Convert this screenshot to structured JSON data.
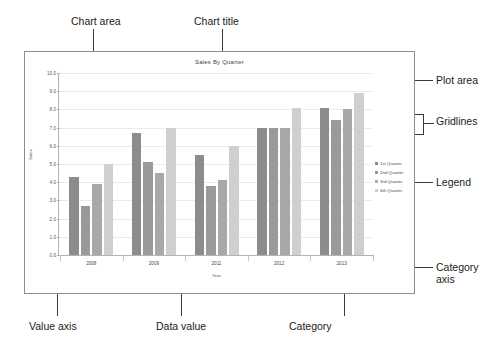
{
  "figure": {
    "annotations": {
      "chart_area": "Chart area",
      "chart_title": "Chart title",
      "data_series": "Data series",
      "plot_area": "Plot area",
      "gridlines": "Gridlines",
      "legend": "Legend",
      "category_axis": "Category\naxis",
      "category_axis_line1": "Category",
      "category_axis_line2": "axis",
      "value_axis": "Value axis",
      "data_value": "Data value",
      "category": "Category"
    }
  },
  "chart_data": {
    "type": "bar",
    "title": "Sales By Quarter",
    "xlabel": "Year",
    "ylabel": "Sales",
    "categories": [
      "2008",
      "2009",
      "2011",
      "2012",
      "2013"
    ],
    "series": [
      {
        "name": "1st Quarter",
        "color": "#8c8c8c",
        "values": [
          4.3,
          6.7,
          5.5,
          7.0,
          8.1
        ]
      },
      {
        "name": "2nd Quarter",
        "color": "#9a9a9a",
        "values": [
          2.7,
          5.1,
          3.8,
          7.0,
          7.4
        ]
      },
      {
        "name": "3rd Quarter",
        "color": "#a8a8a8",
        "values": [
          3.9,
          4.5,
          4.1,
          7.0,
          8.0
        ]
      },
      {
        "name": "4th Quarter",
        "color": "#cfcfcf",
        "values": [
          5.0,
          7.0,
          6.0,
          8.1,
          8.9
        ]
      }
    ],
    "ylim": [
      0,
      10
    ],
    "yticks": [
      "10.0",
      "9.0",
      "8.0",
      "7.0",
      "6.0",
      "5.0",
      "4.0",
      "3.0",
      "2.0",
      "1.0",
      "0.0"
    ],
    "grid": true,
    "legend_position": "right",
    "legend_entries": [
      "1st Quarter",
      "2nd Quarter",
      "3rd Quarter",
      "4th Quarter"
    ]
  }
}
